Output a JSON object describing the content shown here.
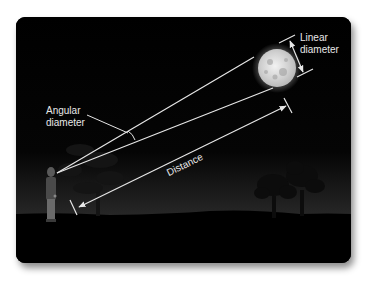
{
  "figure": {
    "labels": {
      "linear_line1": "Linear",
      "linear_line2": "diameter",
      "angular_line1": "Angular",
      "angular_line2": "diameter",
      "distance": "Distance"
    },
    "elements": {
      "observer": "person standing on the left",
      "object": "full moon in the upper right",
      "scenery": "silhouetted trees on a dark horizon"
    },
    "colors": {
      "sky": "#000000",
      "horizon_glow": "#2a2a2a",
      "lines": "#e6e6e6",
      "moon": "#d9d9d9"
    }
  }
}
